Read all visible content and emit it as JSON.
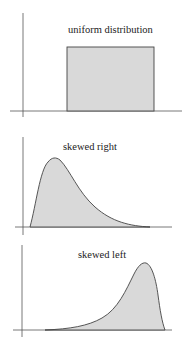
{
  "panels": [
    {
      "title": "uniform distribution",
      "shape": "uniform"
    },
    {
      "title": "skewed right",
      "shape": "right-skewed"
    },
    {
      "title": "skewed left",
      "shape": "left-skewed"
    }
  ],
  "colors": {
    "fill": "#d9d9d9",
    "stroke": "#444444",
    "axis": "#555555"
  }
}
